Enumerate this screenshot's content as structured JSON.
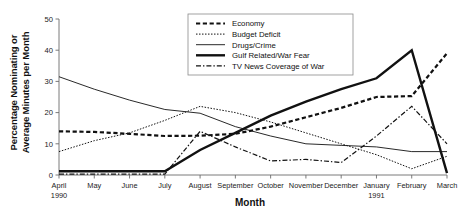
{
  "chart_data": {
    "type": "line",
    "title": "",
    "xlabel": "Month",
    "ylabel": "Percentage Nominating or Average Minutes per Month",
    "ylabel_line1": "Percentage Nominating or",
    "ylabel_line2": "Average Minutes per Month",
    "categories": [
      "April",
      "May",
      "June",
      "July",
      "August",
      "September",
      "October",
      "November",
      "December",
      "January",
      "February",
      "March"
    ],
    "x_year_annotations": [
      {
        "category": "April",
        "year": "1990"
      },
      {
        "category": "January",
        "year": "1991"
      }
    ],
    "yticks": [
      0,
      10,
      20,
      30,
      40,
      50
    ],
    "ytick_labels": [
      "0",
      "10",
      "20",
      "30",
      "40",
      "50"
    ],
    "ylim": [
      0,
      50
    ],
    "grid": false,
    "legend_position": "top-center",
    "series": [
      {
        "name": "Economy",
        "style": "thick-dashed",
        "values": [
          14.0,
          13.8,
          13.2,
          12.5,
          12.6,
          13.2,
          15.5,
          18.5,
          21.5,
          25.0,
          25.3,
          39.0
        ]
      },
      {
        "name": "Budget Deficit",
        "style": "fine-dotted",
        "values": [
          7.5,
          11.0,
          13.5,
          17.5,
          22.0,
          20.0,
          17.0,
          13.5,
          10.0,
          6.5,
          2.0,
          6.0
        ]
      },
      {
        "name": "Drugs/Crime",
        "style": "thin-solid",
        "values": [
          31.5,
          27.5,
          24.0,
          21.0,
          19.8,
          15.5,
          12.5,
          10.0,
          9.5,
          9.0,
          7.5,
          7.5
        ]
      },
      {
        "name": "Gulf Related/War Fear",
        "style": "thick-solid",
        "values": [
          1.2,
          1.2,
          1.2,
          1.2,
          8.0,
          13.5,
          19.0,
          23.5,
          27.5,
          31.0,
          40.0,
          0.6
        ]
      },
      {
        "name": "TV News Coverage of War",
        "style": "dash-dot",
        "values": [
          0.3,
          0.3,
          0.3,
          0.3,
          14.0,
          9.0,
          4.5,
          5.0,
          4.0,
          12.5,
          22.0,
          10.0
        ]
      }
    ]
  },
  "legend": {
    "entries": [
      {
        "label": "Economy",
        "style": "thick-dashed"
      },
      {
        "label": "Budget Deficit",
        "style": "fine-dotted"
      },
      {
        "label": "Drugs/Crime",
        "style": "thin-solid"
      },
      {
        "label": "Gulf Related/War Fear",
        "style": "thick-solid"
      },
      {
        "label": "TV News Coverage of War",
        "style": "dash-dot"
      }
    ]
  },
  "axes": {
    "x_title": "Month",
    "y_title_line1": "Percentage Nominating or",
    "y_title_line2": "Average Minutes per Month"
  },
  "colors": {
    "ink": "#111111",
    "axis": "#6b6b6b",
    "background": "#ffffff"
  }
}
